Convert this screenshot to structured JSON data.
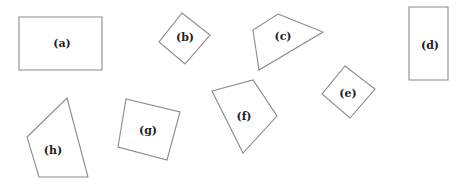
{
  "diagram": {
    "stroke_color": "#8a8a8a",
    "label_color": "#222222",
    "shapes": [
      {
        "id": "a",
        "label": "(a)",
        "kind": "rectangle",
        "points": "19,17 102,17 102,70 19,70",
        "label_x": 62,
        "label_y": 44
      },
      {
        "id": "b",
        "label": "(b)",
        "kind": "square-rotated",
        "points": "182,13 210,35 185,64 159,42",
        "label_x": 185,
        "label_y": 38
      },
      {
        "id": "c",
        "label": "(c)",
        "kind": "quadrilateral",
        "points": "278,14 323,32 259,70 253,30",
        "label_x": 283,
        "label_y": 37
      },
      {
        "id": "d",
        "label": "(d)",
        "kind": "rectangle",
        "points": "409,7 448,7 448,80 409,80",
        "label_x": 430,
        "label_y": 46
      },
      {
        "id": "e",
        "label": "(e)",
        "kind": "square-rotated",
        "points": "345,66 375,89 350,118 322,94",
        "label_x": 348,
        "label_y": 94
      },
      {
        "id": "f",
        "label": "(f)",
        "kind": "quadrilateral",
        "points": "212,91 253,80 277,116 243,153",
        "label_x": 244,
        "label_y": 117
      },
      {
        "id": "g",
        "label": "(g)",
        "kind": "square-rotated",
        "points": "126,99 180,112 167,160 118,147",
        "label_x": 148,
        "label_y": 131
      },
      {
        "id": "h",
        "label": "(h)",
        "kind": "quadrilateral",
        "points": "67,98 88,177 39,177 27,137",
        "label_x": 53,
        "label_y": 151
      }
    ]
  }
}
